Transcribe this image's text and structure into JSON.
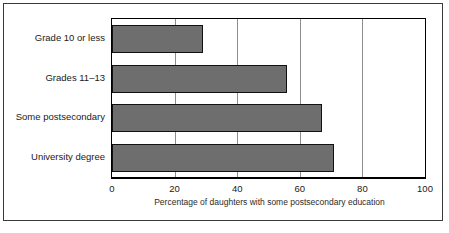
{
  "chart_data": {
    "type": "bar",
    "orientation": "horizontal",
    "title": "",
    "xlabel": "Percentage of daughters with some postsecondary education",
    "ylabel": "",
    "categories": [
      "Grade 10 or less",
      "Grades 11–13",
      "Some postsecondary",
      "University degree"
    ],
    "values": [
      29,
      56,
      67,
      71
    ],
    "xlim": [
      0,
      100
    ],
    "xticks": [
      0,
      20,
      40,
      60,
      80,
      100
    ],
    "xtick_labels": [
      "0",
      "20",
      "40",
      "60",
      "80",
      "100"
    ],
    "gridlines": {
      "vertical": [
        20,
        40,
        60,
        80
      ],
      "horizontal": false
    },
    "legend": null,
    "colors": {
      "bar_fill": "#6e6e6e",
      "bar_outline": "#111111",
      "plot_background": "#ffffff",
      "axis": "#000000",
      "gridline": "#8d8d8d",
      "frame": "#3a3a3a",
      "text": "#1a1a1a"
    }
  }
}
